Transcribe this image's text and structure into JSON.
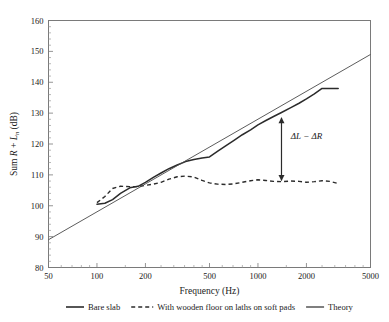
{
  "chart_data": {
    "type": "line",
    "title": "",
    "xlabel": "Frequency (Hz)",
    "ylabel": "Sum R + Lₙ (dB)",
    "ylabel_parts": {
      "prefix": "Sum ",
      "r": "R",
      "plus": " + ",
      "l": "L",
      "sub": "n",
      "units": " (dB)"
    },
    "xscale": "log",
    "xlim": [
      50,
      5000
    ],
    "ylim": [
      80,
      160
    ],
    "xticks": [
      50,
      100,
      200,
      500,
      1000,
      2000,
      5000
    ],
    "xtick_labels": [
      "50",
      "100",
      "200",
      "500",
      "1000",
      "2000",
      "5000"
    ],
    "yticks": [
      80,
      90,
      100,
      110,
      120,
      130,
      140,
      150,
      160
    ],
    "ytick_labels": [
      "80",
      "90",
      "100",
      "110",
      "120",
      "130",
      "140",
      "150",
      "160"
    ],
    "grid": false,
    "legend_position": "below-plot",
    "series": [
      {
        "name": "Bare slab",
        "style": "solid",
        "color": "#2b2b2b",
        "x": [
          100,
          112,
          125,
          140,
          160,
          180,
          200,
          224,
          250,
          280,
          315,
          355,
          400,
          450,
          500,
          560,
          630,
          710,
          800,
          900,
          1000,
          1120,
          1250,
          1400,
          1600,
          1800,
          2000,
          2240,
          2500,
          2800,
          3150
        ],
        "y": [
          100.5,
          100.8,
          102.0,
          104.0,
          105.8,
          106.3,
          107.6,
          109.2,
          110.6,
          112.0,
          113.2,
          114.3,
          115.0,
          115.5,
          115.8,
          117.6,
          119.4,
          121.2,
          123.0,
          124.6,
          126.2,
          127.6,
          128.9,
          130.2,
          131.8,
          133.2,
          134.6,
          136.2,
          138.0,
          138.0,
          138.0
        ]
      },
      {
        "name": "With wooden floor on laths on soft pads",
        "style": "dashed",
        "color": "#2b2b2b",
        "x": [
          100,
          112,
          125,
          140,
          160,
          180,
          200,
          224,
          250,
          280,
          315,
          355,
          400,
          450,
          500,
          560,
          630,
          710,
          800,
          900,
          1000,
          1120,
          1250,
          1400,
          1600,
          1800,
          2000,
          2240,
          2500,
          2800,
          3150
        ],
        "y": [
          101.0,
          103.0,
          105.6,
          106.3,
          106.2,
          106.2,
          106.6,
          107.0,
          107.6,
          108.6,
          109.4,
          109.6,
          109.3,
          108.2,
          107.4,
          107.0,
          106.9,
          107.1,
          107.6,
          108.1,
          108.4,
          108.2,
          107.9,
          107.8,
          108.0,
          107.9,
          107.6,
          107.8,
          108.1,
          107.9,
          107.2
        ]
      },
      {
        "name": "Theory",
        "style": "solid-thin",
        "color": "#4a4a4a",
        "x": [
          50,
          5000
        ],
        "y": [
          89.0,
          149.0
        ]
      }
    ],
    "annotations": [
      {
        "text": "ΔL − ΔR",
        "type": "double-arrow",
        "x": 1400,
        "y_top": 128.5,
        "y_bottom": 108.2,
        "label_x": 1600,
        "label_y": 121.5
      }
    ]
  },
  "legend": {
    "items": [
      {
        "label": "Bare slab",
        "style": "solid"
      },
      {
        "label": "With wooden floor on laths on soft pads",
        "style": "dashed"
      },
      {
        "label": "Theory",
        "style": "solid-thin"
      }
    ]
  }
}
